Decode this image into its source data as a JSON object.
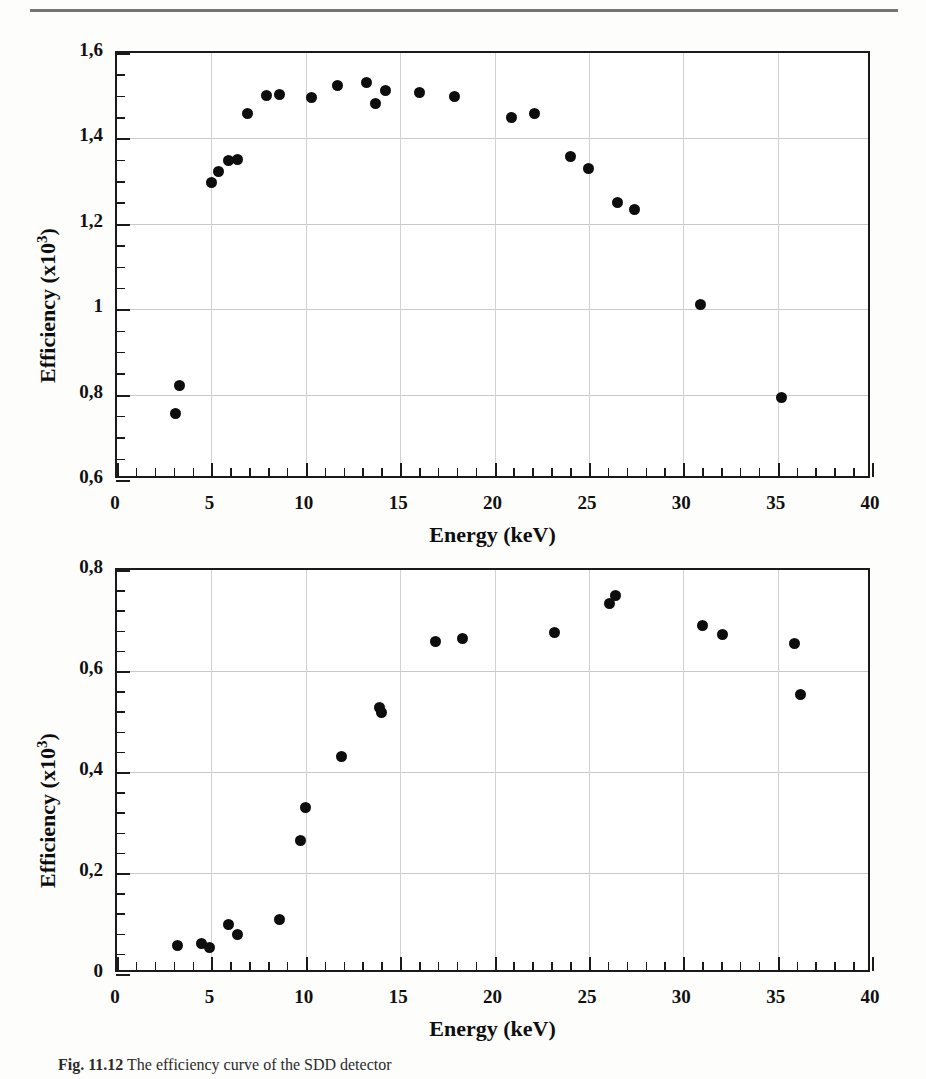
{
  "page": {
    "rule_color": "#5c5c5c",
    "background": "#fdfdfc",
    "marker_color": "#0d0d0d"
  },
  "caption": {
    "label": "Fig. 11.12",
    "text": "The efficiency curve of the SDD detector"
  },
  "chart_data": [
    {
      "id": "top",
      "type": "scatter",
      "title": "",
      "xlabel": "Energy (keV)",
      "ylabel": "Efficiency (x10³)",
      "ylabel_base": "Efficiency (x10",
      "ylabel_exp": "3",
      "ylabel_close": ")",
      "xlim": [
        0,
        40
      ],
      "ylim": [
        0.6,
        1.6
      ],
      "xticks": [
        0,
        5,
        10,
        15,
        20,
        25,
        30,
        35,
        40
      ],
      "xticklabels": [
        "0",
        "5",
        "10",
        "15",
        "20",
        "25",
        "30",
        "35",
        "40"
      ],
      "yticks": [
        0.6,
        0.8,
        1.0,
        1.2,
        1.4,
        1.6
      ],
      "yticklabels": [
        "0,6",
        "0,8",
        "1",
        "1,2",
        "1,4",
        "1,6"
      ],
      "x_minor_step": 1,
      "y_minor_step": 0.05,
      "grid": true,
      "legend": "none",
      "x": [
        3.1,
        3.3,
        5.0,
        5.4,
        5.9,
        6.4,
        6.9,
        7.9,
        8.6,
        10.3,
        11.7,
        13.2,
        13.7,
        14.2,
        16.0,
        17.9,
        20.9,
        22.1,
        24.0,
        25.0,
        26.5,
        27.4,
        30.9,
        35.2
      ],
      "y": [
        0.755,
        0.822,
        1.296,
        1.322,
        1.348,
        1.35,
        1.458,
        1.5,
        1.502,
        1.496,
        1.523,
        1.532,
        1.481,
        1.512,
        1.508,
        1.498,
        1.448,
        1.458,
        1.357,
        1.33,
        1.25,
        1.233,
        1.012,
        0.793
      ]
    },
    {
      "id": "bottom",
      "type": "scatter",
      "title": "",
      "xlabel": "Energy (keV)",
      "ylabel": "Efficiency (x10³)",
      "ylabel_base": "Efficiency (x10",
      "ylabel_exp": "3",
      "ylabel_close": ")",
      "xlim": [
        0,
        40
      ],
      "ylim": [
        0,
        0.8
      ],
      "xticks": [
        0,
        5,
        10,
        15,
        20,
        25,
        30,
        35,
        40
      ],
      "xticklabels": [
        "0",
        "5",
        "10",
        "15",
        "20",
        "25",
        "30",
        "35",
        "40"
      ],
      "yticks": [
        0,
        0.2,
        0.4,
        0.6,
        0.8
      ],
      "yticklabels": [
        "0",
        "0,2",
        "0,4",
        "0,6",
        "0,8"
      ],
      "x_minor_step": 1,
      "y_minor_step": 0.04,
      "grid": true,
      "legend": "none",
      "x": [
        3.2,
        4.5,
        4.9,
        5.9,
        6.4,
        8.6,
        9.7,
        10.0,
        11.9,
        13.9,
        14.0,
        16.9,
        18.3,
        23.2,
        26.1,
        26.4,
        31.0,
        32.1,
        35.9,
        36.2
      ],
      "y": [
        0.056,
        0.06,
        0.052,
        0.098,
        0.078,
        0.108,
        0.265,
        0.33,
        0.43,
        0.527,
        0.517,
        0.658,
        0.665,
        0.676,
        0.733,
        0.75,
        0.69,
        0.673,
        0.655,
        0.554
      ]
    }
  ]
}
